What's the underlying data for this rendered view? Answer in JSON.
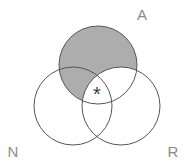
{
  "figure": {
    "type": "venn-3-circle",
    "sets": [
      {
        "id": "A",
        "label": "A",
        "shaded": true,
        "position": "top"
      },
      {
        "id": "N",
        "label": "N",
        "shaded": false,
        "position": "bottom-left"
      },
      {
        "id": "R",
        "label": "R",
        "shaded": false,
        "position": "bottom-right"
      }
    ],
    "shaded_region": "A minus R (parts of circle A not overlapping circle R)",
    "center_marker": "*",
    "center_marker_region": "intersection of A, N and R"
  },
  "colors": {
    "shaded_fill": "#adadad",
    "circle_outline": "#555555",
    "label_text": "#8c8c8c",
    "marker_text": "#3d3d3d",
    "background": "#ffffff"
  }
}
